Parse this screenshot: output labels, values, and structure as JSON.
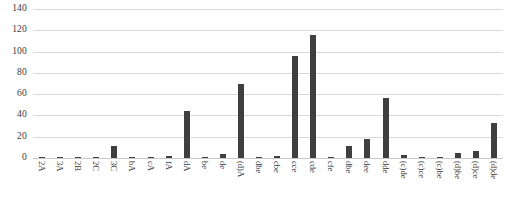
{
  "chart_data": {
    "type": "bar",
    "title": "",
    "subtitle": "",
    "xlabel": "",
    "ylabel": "",
    "ylim": [
      0,
      140
    ],
    "ytick_step": 20,
    "yticks": [
      "0",
      "20",
      "40",
      "60",
      "80",
      "100",
      "120",
      "140"
    ],
    "grid": true,
    "legend": false,
    "legend_position": "none",
    "bar_color": "#3f3f3f",
    "gridline_color": "#d9d9d9",
    "categories": [
      "2A",
      "3A",
      "2B",
      "2C",
      "3C",
      "bA",
      "cA",
      "fA",
      "dA",
      "be",
      "de",
      "(d)A",
      "dbe",
      "cbe",
      "cce",
      "cde",
      "cfe",
      "dbe",
      "dee",
      "dde",
      "(c)de",
      "(c)ce",
      "(c)be",
      "(d)be",
      "(d)ce",
      "(d)de"
    ],
    "values": [
      0.5,
      0.5,
      0.5,
      0.5,
      11,
      1,
      0.5,
      2,
      44,
      0.5,
      4,
      70,
      1,
      2,
      96,
      116,
      0.5,
      11,
      18,
      56,
      3,
      0.5,
      0.5,
      5,
      7,
      33
    ],
    "series": [
      {
        "name": "values",
        "values": [
          0.5,
          0.5,
          0.5,
          0.5,
          11,
          1,
          0.5,
          2,
          44,
          0.5,
          4,
          70,
          1,
          2,
          96,
          116,
          0.5,
          11,
          18,
          56,
          3,
          0.5,
          0.5,
          5,
          7,
          33
        ]
      }
    ]
  }
}
